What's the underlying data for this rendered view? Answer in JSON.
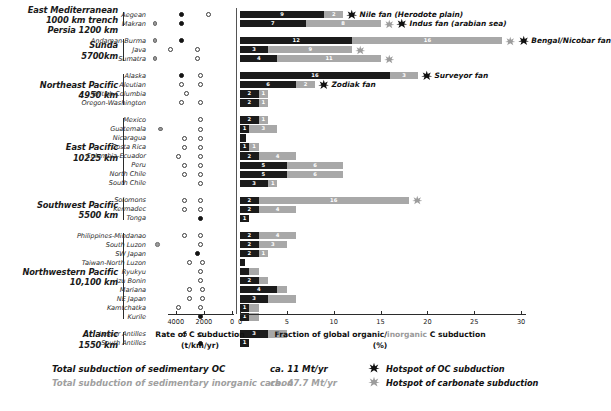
{
  "chart_data": {
    "type": "bar",
    "title": "",
    "xlabel_left": "Rate of C subduction (t/km/yr)",
    "xlabel_right": "Fraction of global organic/inorganic C subduction (%)",
    "axis_left": {
      "label_main": "Rate of C subduction",
      "label_unit": "(t/km/yr)",
      "ticks": [
        4000,
        2000,
        0
      ],
      "tick_labels": [
        "4000",
        "2000",
        "0"
      ],
      "reversed": true
    },
    "axis_right": {
      "label_main_a": "Fraction of global organic/",
      "label_main_b": "inorganic",
      "label_main_c": " C subduction",
      "label_unit": "(%)",
      "ticks": [
        0,
        5,
        10,
        15,
        20,
        25,
        30
      ],
      "tick_labels": [
        "0",
        "5",
        "10",
        "15",
        "20",
        "25",
        "30"
      ],
      "xlim": [
        0,
        30.5
      ],
      "grid": false
    },
    "series": [
      {
        "name": "organic carbon (OC)",
        "color": "#1b1b1b"
      },
      {
        "name": "inorganic carbon",
        "color": "#a8a8a8"
      }
    ],
    "groups": [
      {
        "region_label": "East Mediterranean\n1000 km trench\nPersia 1200 km",
        "margins": [
          {
            "name": "Aegean",
            "oc": 9,
            "ic": 2,
            "oc_label": "9",
            "ic_label": "2",
            "scatter": [
              {
                "col": 2,
                "style": "filled"
              },
              {
                "col": 3,
                "style": "open"
              }
            ],
            "annotation": "Nile fan (Herodote plain)",
            "star_oc": true,
            "star_ic": false
          },
          {
            "name": "Makran",
            "oc": 7,
            "ic": 8,
            "oc_label": "7",
            "ic_label": "8",
            "scatter": [
              {
                "col": 1,
                "style": "grey"
              },
              {
                "col": 2,
                "style": "filled"
              }
            ],
            "annotation": "Indus fan (arabian sea)",
            "star_oc": true,
            "star_ic": true
          }
        ]
      },
      {
        "region_label": "Sunda\n5700km",
        "margins": [
          {
            "name": "Andaman-Burma",
            "oc": 12,
            "ic": 16,
            "oc_label": "12",
            "ic_label": "16",
            "scatter": [
              {
                "col": 1,
                "style": "grey"
              },
              {
                "col": 2,
                "style": "filled"
              }
            ],
            "annotation": "Bengal/Nicobar fan",
            "star_oc": true,
            "star_ic": true
          },
          {
            "name": "Java",
            "oc": 3,
            "ic": 9,
            "oc_label": "3",
            "ic_label": "9",
            "scatter": [
              {
                "col": 1.6,
                "style": "open"
              },
              {
                "col": 2.6,
                "style": "open"
              }
            ],
            "annotation": "",
            "star_oc": false,
            "star_ic": true
          },
          {
            "name": "Sumatra",
            "oc": 4,
            "ic": 11,
            "oc_label": "4",
            "ic_label": "11",
            "scatter": [
              {
                "col": 1,
                "style": "grey"
              },
              {
                "col": 2.6,
                "style": "open"
              }
            ],
            "annotation": "",
            "star_oc": false,
            "star_ic": true
          }
        ]
      },
      {
        "region_label": "Northeast Pacific\n4950 km",
        "margins": [
          {
            "name": "Alaska",
            "oc": 16,
            "ic": 3,
            "oc_label": "16",
            "ic_label": "3",
            "scatter": [
              {
                "col": 2,
                "style": "filled"
              },
              {
                "col": 2.7,
                "style": "open"
              }
            ],
            "annotation": "Surveyor fan",
            "star_oc": true,
            "star_ic": false
          },
          {
            "name": "Aleutian",
            "oc": 6,
            "ic": 2,
            "oc_label": "6",
            "ic_label": "2",
            "scatter": [
              {
                "col": 2,
                "style": "open"
              },
              {
                "col": 2.7,
                "style": "open"
              }
            ],
            "annotation": "Zodiak fan",
            "star_oc": true,
            "star_ic": false
          },
          {
            "name": "British Columbia",
            "oc": 2,
            "ic": 1,
            "oc_label": "2",
            "ic_label": "1",
            "scatter": [
              {
                "col": 2.2,
                "style": "open"
              }
            ],
            "annotation": "",
            "star_oc": false,
            "star_ic": false
          },
          {
            "name": "Oregon-Washington",
            "oc": 2,
            "ic": 1,
            "oc_label": "2",
            "ic_label": "1",
            "scatter": [
              {
                "col": 2,
                "style": "open"
              },
              {
                "col": 2.7,
                "style": "open"
              }
            ],
            "annotation": "",
            "star_oc": false,
            "star_ic": false
          }
        ]
      },
      {
        "region_label": "East Pacific\n10225 km",
        "margins": [
          {
            "name": "Mexico",
            "oc": 2,
            "ic": 1,
            "oc_label": "2",
            "ic_label": "1",
            "scatter": [
              {
                "col": 2.7,
                "style": "open"
              }
            ],
            "annotation": "",
            "star_oc": false,
            "star_ic": false
          },
          {
            "name": "Guatemala",
            "oc": 1,
            "ic": 3,
            "oc_label": "1",
            "ic_label": "3",
            "scatter": [
              {
                "col": 1.2,
                "style": "grey"
              },
              {
                "col": 2.7,
                "style": "open"
              }
            ],
            "annotation": "",
            "star_oc": false,
            "star_ic": false
          },
          {
            "name": "Nicaragua",
            "oc": 0.6,
            "ic": 0,
            "oc_label": "",
            "ic_label": "",
            "scatter": [
              {
                "col": 2.1,
                "style": "open"
              },
              {
                "col": 2.7,
                "style": "open"
              }
            ],
            "annotation": "",
            "star_oc": false,
            "star_ic": false
          },
          {
            "name": "Costa Rica",
            "oc": 1,
            "ic": 1,
            "oc_label": "1",
            "ic_label": "1",
            "scatter": [
              {
                "col": 2.1,
                "style": "open"
              },
              {
                "col": 2.7,
                "style": "open"
              }
            ],
            "annotation": "",
            "star_oc": false,
            "star_ic": false
          },
          {
            "name": "Columbia-Ecuador",
            "oc": 2,
            "ic": 4,
            "oc_label": "2",
            "ic_label": "4",
            "scatter": [
              {
                "col": 1.9,
                "style": "open"
              },
              {
                "col": 2.7,
                "style": "open"
              }
            ],
            "annotation": "",
            "star_oc": false,
            "star_ic": false
          },
          {
            "name": "Peru",
            "oc": 5,
            "ic": 6,
            "oc_label": "5",
            "ic_label": "6",
            "scatter": [
              {
                "col": 2.1,
                "style": "open"
              },
              {
                "col": 2.7,
                "style": "open"
              }
            ],
            "annotation": "",
            "star_oc": false,
            "star_ic": false
          },
          {
            "name": "North Chile",
            "oc": 5,
            "ic": 6,
            "oc_label": "5",
            "ic_label": "6",
            "scatter": [
              {
                "col": 2.1,
                "style": "open"
              },
              {
                "col": 2.7,
                "style": "open"
              }
            ],
            "annotation": "",
            "star_oc": false,
            "star_ic": false
          },
          {
            "name": "South Chile",
            "oc": 3,
            "ic": 1,
            "oc_label": "3",
            "ic_label": "1",
            "scatter": [
              {
                "col": 2.7,
                "style": "open"
              }
            ],
            "annotation": "",
            "star_oc": false,
            "star_ic": false
          }
        ]
      },
      {
        "region_label": "Southwest Pacific\n5500 km",
        "margins": [
          {
            "name": "Solomons",
            "oc": 2,
            "ic": 16,
            "oc_label": "2",
            "ic_label": "16",
            "scatter": [
              {
                "col": 2.1,
                "style": "open"
              },
              {
                "col": 2.7,
                "style": "open"
              }
            ],
            "annotation": "",
            "star_oc": false,
            "star_ic": true
          },
          {
            "name": "Kermadec",
            "oc": 2,
            "ic": 4,
            "oc_label": "2",
            "ic_label": "4",
            "scatter": [
              {
                "col": 2.1,
                "style": "open"
              },
              {
                "col": 2.7,
                "style": "open"
              }
            ],
            "annotation": "",
            "star_oc": false,
            "star_ic": false
          },
          {
            "name": "Tonga",
            "oc": 1,
            "ic": 0,
            "oc_label": "1",
            "ic_label": "",
            "scatter": [
              {
                "col": 2.7,
                "style": "filled"
              }
            ],
            "annotation": "",
            "star_oc": false,
            "star_ic": false
          }
        ]
      },
      {
        "region_label": "Northwestern Pacific\n10,100 km",
        "margins": [
          {
            "name": "Philippines-Mindanao",
            "oc": 2,
            "ic": 4,
            "oc_label": "2",
            "ic_label": "4",
            "scatter": [
              {
                "col": 2.1,
                "style": "open"
              },
              {
                "col": 2.7,
                "style": "open"
              }
            ],
            "annotation": "",
            "star_oc": false,
            "star_ic": false
          },
          {
            "name": "South Luzon",
            "oc": 2,
            "ic": 3,
            "oc_label": "2",
            "ic_label": "3",
            "scatter": [
              {
                "col": 1.1,
                "style": "grey"
              },
              {
                "col": 2.7,
                "style": "open"
              }
            ],
            "annotation": "",
            "star_oc": false,
            "star_ic": false
          },
          {
            "name": "SW Japan",
            "oc": 2,
            "ic": 1,
            "oc_label": "2",
            "ic_label": "1",
            "scatter": [
              {
                "col": 2.6,
                "style": "filled"
              }
            ],
            "annotation": "",
            "star_oc": false,
            "star_ic": false
          },
          {
            "name": "Taiwan-North Luzon",
            "oc": 0.5,
            "ic": 0,
            "oc_label": "",
            "ic_label": "",
            "scatter": [
              {
                "col": 2.3,
                "style": "open"
              },
              {
                "col": 2.8,
                "style": "open"
              }
            ],
            "annotation": "",
            "star_oc": false,
            "star_ic": false
          },
          {
            "name": "Ryukyu",
            "oc": 1,
            "ic": 1,
            "oc_label": "",
            "ic_label": "",
            "scatter": [
              {
                "col": 2.7,
                "style": "open"
              }
            ],
            "annotation": "",
            "star_oc": false,
            "star_ic": false
          },
          {
            "name": "Izu Bonin",
            "oc": 2,
            "ic": 1,
            "oc_label": "2",
            "ic_label": "",
            "scatter": [
              {
                "col": 2.7,
                "style": "open"
              }
            ],
            "annotation": "",
            "star_oc": false,
            "star_ic": false
          },
          {
            "name": "Mariana",
            "oc": 4,
            "ic": 1,
            "oc_label": "4",
            "ic_label": "",
            "scatter": [
              {
                "col": 2.3,
                "style": "open"
              },
              {
                "col": 2.8,
                "style": "open"
              }
            ],
            "annotation": "",
            "star_oc": false,
            "star_ic": false
          },
          {
            "name": "NE Japan",
            "oc": 3,
            "ic": 3,
            "oc_label": "3",
            "ic_label": "",
            "scatter": [
              {
                "col": 2.3,
                "style": "open"
              },
              {
                "col": 2.8,
                "style": "open"
              }
            ],
            "annotation": "",
            "star_oc": false,
            "star_ic": false
          },
          {
            "name": "Kamtchatka",
            "oc": 1,
            "ic": 1,
            "oc_label": "1",
            "ic_label": "",
            "scatter": [
              {
                "col": 1.9,
                "style": "open"
              },
              {
                "col": 2.7,
                "style": "open"
              }
            ],
            "annotation": "",
            "star_oc": false,
            "star_ic": false
          },
          {
            "name": "Kurile",
            "oc": 1,
            "ic": 1,
            "oc_label": "1",
            "ic_label": "",
            "scatter": [
              {
                "col": 2.7,
                "style": "filled"
              }
            ],
            "annotation": "",
            "star_oc": false,
            "star_ic": false
          }
        ]
      },
      {
        "region_label": "Atlantic\n1550 km",
        "margins": [
          {
            "name": "Lesser Antilles",
            "oc": 3,
            "ic": 2,
            "oc_label": "3",
            "ic_label": "2",
            "scatter": [
              {
                "col": 2.1,
                "style": "open"
              },
              {
                "col": 2.7,
                "style": "open"
              }
            ],
            "annotation": "",
            "star_oc": false,
            "star_ic": false
          },
          {
            "name": "South Antilles",
            "oc": 1,
            "ic": 0,
            "oc_label": "1",
            "ic_label": "",
            "scatter": [
              {
                "col": 2.7,
                "style": "filled"
              }
            ],
            "annotation": "",
            "star_oc": false,
            "star_ic": false
          }
        ]
      }
    ]
  },
  "legend": {
    "row1_text": "Total subduction of sedimentary OC",
    "row1_value": "ca. 11 Mt/yr",
    "row2_text": "Total subduction of sedimentary inorganic carbon",
    "row2_value": "ca. 47.7 Mt/yr",
    "marker1_label": "Hotspot of OC subduction",
    "marker2_label": "Hotspot of carbonate subduction",
    "marker1_icon": "black-star-icon",
    "marker2_icon": "grey-star-icon"
  },
  "colors": {
    "oc": "#1b1b1b",
    "ic": "#a8a8a8",
    "text": "#111111",
    "axis": "#2b2b2b"
  }
}
